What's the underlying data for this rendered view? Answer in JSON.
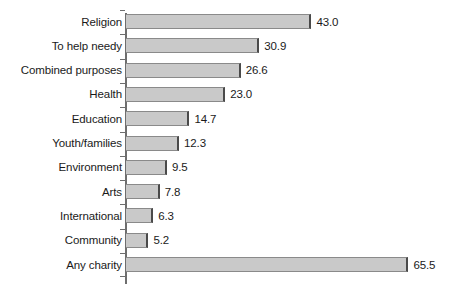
{
  "chart_data": {
    "type": "bar",
    "orientation": "horizontal",
    "title": "",
    "subtitle": "",
    "xlabel": "",
    "ylabel": "",
    "xlim": [
      0,
      65.5
    ],
    "grid": false,
    "legend": null,
    "value_labels_shown": true,
    "categories": [
      "Religion",
      "To help needy",
      "Combined purposes",
      "Health",
      "Education",
      "Youth/families",
      "Environment",
      "Arts",
      "International",
      "Community",
      "Any charity"
    ],
    "values": [
      43.0,
      30.9,
      26.6,
      23.0,
      14.7,
      12.3,
      9.5,
      7.8,
      6.3,
      5.2,
      65.5
    ],
    "value_label_text": [
      "43.0",
      "30.9",
      "26.6",
      "23.0",
      "14.7",
      "12.3",
      "9.5",
      "7.8",
      "6.3",
      "5.2",
      "65.5"
    ],
    "colors": {
      "bar_fill": "#c9c9c9",
      "bar_edge": "#4a4a4a",
      "axis": "#6e6e6e",
      "text": "#1a1a1a",
      "background": "#ffffff"
    }
  }
}
